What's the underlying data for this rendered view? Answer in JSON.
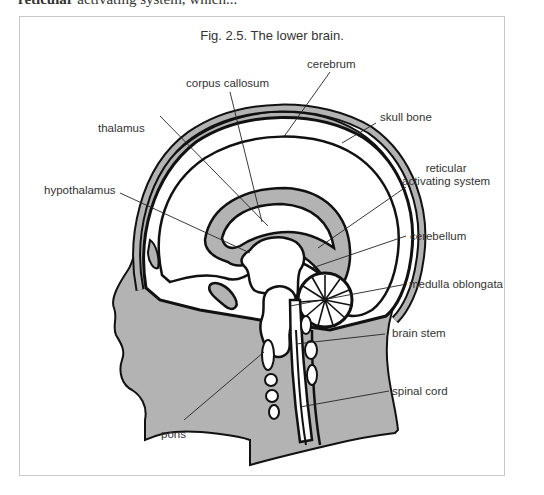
{
  "page": {
    "cut_off_text_bold": "reticular",
    "cut_off_text_rest": "activating system, which..."
  },
  "figure": {
    "title": "Fig. 2.5. The lower brain.",
    "colors": {
      "fill_gray": "#b3b3b3",
      "line": "#111111",
      "label_text": "#333333",
      "frame_border": "#c8c8c8"
    },
    "labels": {
      "cerebrum": "cerebrum",
      "corpus_callosum": "corpus callosum",
      "skull_bone": "skull bone",
      "thalamus": "thalamus",
      "reticular_line1": "reticular",
      "reticular_line2": "activating system",
      "hypothalamus": "hypothalamus",
      "cerebellum": "cerebellum",
      "medulla_oblongata": "medulla oblongata",
      "brain_stem": "brain stem",
      "spinal_cord": "spinal cord",
      "pons": "pons"
    }
  }
}
